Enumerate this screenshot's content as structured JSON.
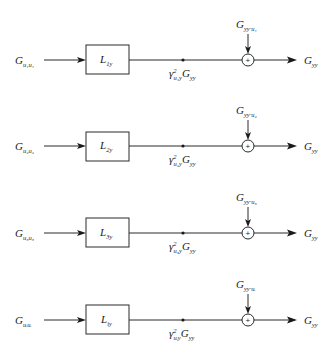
{
  "diagram": {
    "type": "block-diagram",
    "rows": [
      {
        "input": {
          "main": "G",
          "sub": "u₁u₁"
        },
        "block": {
          "main": "L",
          "sub": "1y"
        },
        "node": {
          "gamma": "γ",
          "sup": "2",
          "gamma_sub": "u₁y",
          "tail": "G",
          "tail_sub": "yy"
        },
        "noise": {
          "main": "G",
          "sub": "yy·u₁"
        },
        "sum_sign": "+",
        "output": {
          "main": "G",
          "sub": "yy"
        }
      },
      {
        "input": {
          "main": "G",
          "sub": "u₂u₂"
        },
        "block": {
          "main": "L",
          "sub": "2y"
        },
        "node": {
          "gamma": "γ",
          "sup": "2",
          "gamma_sub": "u₂y",
          "tail": "G",
          "tail_sub": "yy"
        },
        "noise": {
          "main": "G",
          "sub": "yy·u₂"
        },
        "sum_sign": "+",
        "output": {
          "main": "G",
          "sub": "yy"
        }
      },
      {
        "input": {
          "main": "G",
          "sub": "u₃u₃"
        },
        "block": {
          "main": "L",
          "sub": "3y"
        },
        "node": {
          "gamma": "γ",
          "sup": "2",
          "gamma_sub": "u₃y",
          "tail": "G",
          "tail_sub": "yy"
        },
        "noise": {
          "main": "G",
          "sub": "yy·u₃"
        },
        "sum_sign": "+",
        "output": {
          "main": "G",
          "sub": "yy"
        }
      },
      {
        "input": {
          "main": "G",
          "sub": "uᵢuᵢ"
        },
        "block": {
          "main": "L",
          "sub": "iy"
        },
        "node": {
          "gamma": "γ",
          "sup": "2",
          "gamma_sub": "uᵢy",
          "tail": "G",
          "tail_sub": "yy"
        },
        "noise": {
          "main": "G",
          "sub": "yy·uᵢ"
        },
        "sum_sign": "+",
        "output": {
          "main": "G",
          "sub": "yy"
        }
      }
    ]
  }
}
